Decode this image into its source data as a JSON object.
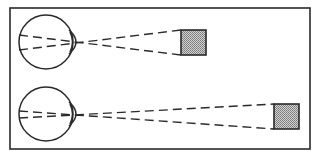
{
  "diagram": {
    "title": "",
    "colors": {
      "stroke": "#2a2a2a",
      "object_fill": "#b8b8b8",
      "background": "#ffffff"
    },
    "frame": {
      "x": 10,
      "y": 8,
      "width": 300,
      "height": 141
    },
    "panels": [
      {
        "name": "near-object",
        "eye": {
          "cx": 46,
          "cy": 42,
          "r": 27
        },
        "nodal_point": {
          "x": 77,
          "y": 43
        },
        "rays_retina": [
          {
            "x": 19,
            "y": 35
          },
          {
            "x": 19,
            "y": 50
          }
        ],
        "object": {
          "x": 181,
          "y": 30,
          "size": 25
        }
      },
      {
        "name": "far-object",
        "eye": {
          "cx": 46,
          "cy": 114,
          "r": 27
        },
        "nodal_point": {
          "x": 76,
          "y": 114
        },
        "rays_retina": [
          {
            "x": 19,
            "y": 111
          },
          {
            "x": 19,
            "y": 118
          }
        ],
        "object": {
          "x": 274,
          "y": 104,
          "size": 25
        }
      }
    ]
  }
}
